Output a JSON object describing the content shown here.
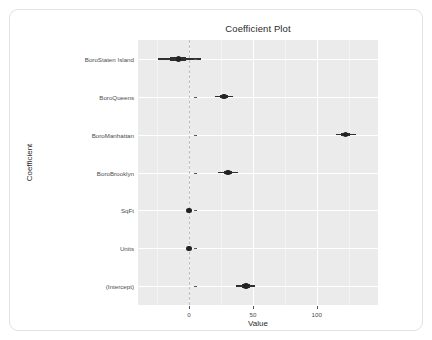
{
  "chart_data": {
    "type": "scatter",
    "title": "Coefficient Plot",
    "xlabel": "Value",
    "ylabel": "Coefficient",
    "orientation": "horizontal",
    "grid": true,
    "legend": false,
    "xlim": [
      -40,
      148
    ],
    "xticks": [
      0,
      50,
      100
    ],
    "xtick_labels": [
      "0",
      "50",
      "100"
    ],
    "reference_line": 0,
    "categories": [
      "BoroStaten Island",
      "BoroQueens",
      "BoroManhattan",
      "BoroBrooklyn",
      "SqFt",
      "Units",
      "(Intercept)"
    ],
    "values": [
      -8.5,
      27.3,
      122.7,
      30.5,
      0.0,
      0.0,
      44.5
    ],
    "ci_inner_low": [
      -14.8,
      24.0,
      119.0,
      27.0,
      0.0,
      0.0,
      41.5
    ],
    "ci_inner_high": [
      -2.3,
      30.6,
      126.4,
      34.0,
      0.0,
      0.0,
      47.5
    ],
    "ci_outer_low": [
      -24.5,
      20.0,
      115.0,
      22.5,
      0.0,
      0.0,
      37.0
    ],
    "ci_outer_high": [
      9.0,
      34.5,
      130.5,
      38.5,
      0.0,
      0.0,
      52.0
    ],
    "series": [
      {
        "name": "Coefficient estimate",
        "points": [
          {
            "label": "BoroStaten Island",
            "value": -8.5,
            "inner": [
              -14.8,
              -2.3
            ],
            "outer": [
              -24.5,
              9.0
            ]
          },
          {
            "label": "BoroQueens",
            "value": 27.3,
            "inner": [
              24.0,
              30.6
            ],
            "outer": [
              20.0,
              34.5
            ]
          },
          {
            "label": "BoroManhattan",
            "value": 122.7,
            "inner": [
              119.0,
              126.4
            ],
            "outer": [
              115.0,
              130.5
            ]
          },
          {
            "label": "BoroBrooklyn",
            "value": 30.5,
            "inner": [
              27.0,
              34.0
            ],
            "outer": [
              22.5,
              38.5
            ]
          },
          {
            "label": "SqFt",
            "value": 0.0,
            "inner": [
              0.0,
              0.0
            ],
            "outer": [
              0.0,
              0.0
            ]
          },
          {
            "label": "Units",
            "value": 0.0,
            "inner": [
              0.0,
              0.0
            ],
            "outer": [
              0.0,
              0.0
            ]
          },
          {
            "label": "(Intercept)",
            "value": 44.5,
            "inner": [
              41.5,
              47.5
            ],
            "outer": [
              37.0,
              52.0
            ]
          }
        ]
      }
    ],
    "colors": {
      "panel_background": "#ebebeb",
      "grid_major": "#ffffff",
      "grid_minor": "#f4f4f4",
      "point": "#222222",
      "interval": "#2f2f2f",
      "reference_line": "#bdbdbd",
      "card_border": "#e2e2e2",
      "text": "#4d4d4d"
    }
  }
}
